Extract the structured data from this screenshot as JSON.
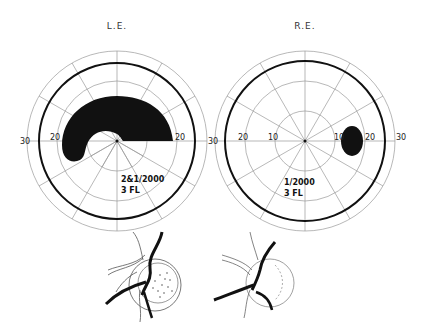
{
  "figure": {
    "type": "visual field perimetry charts with optic disc drawings",
    "left_eye": {
      "title": "L.E.",
      "axis_labels": {
        "left_30": "30",
        "left_20": "20",
        "left_10": "10",
        "right_20": "20",
        "right_30": "30"
      },
      "test_object": "2&1/2000",
      "luminance": "3 FL",
      "defect": "arcuate scotoma (Bjerrum) superior field from ~20° nasal to ~20° temporal",
      "optic_disc": "disc drawing with stippled cupping"
    },
    "right_eye": {
      "title": "R.E.",
      "axis_labels": {
        "left_30": "30",
        "left_20": "20",
        "left_10": "10",
        "right_10": "10",
        "right_20": "20",
        "right_30": "30"
      },
      "test_object": "1/2000",
      "luminance": "3 FL",
      "defect": "blind spot enlarged ~12°–18° temporal",
      "optic_disc": "disc drawing with vessels"
    },
    "colors": {
      "ink": "#111111",
      "grid": "#888888",
      "background": "#ffffff"
    }
  }
}
